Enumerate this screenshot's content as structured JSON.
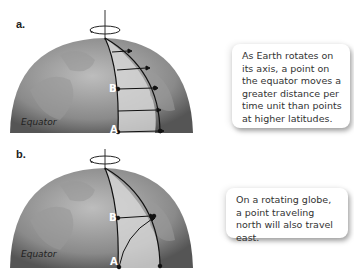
{
  "panels": [
    {
      "label": "a.",
      "equator_label": "Equator",
      "point_a": "A",
      "point_b": "B",
      "callout_text": "As Earth rotates on its axis, a point on the equator moves a greater distance per time unit than points at higher latitudes."
    },
    {
      "label": "b.",
      "equator_label": "Equator",
      "point_a": "A",
      "point_b": "B",
      "callout_text": "On a rotating globe, a point traveling north will also travel east."
    }
  ],
  "colors": {
    "globe_dark": "#6b6b6b",
    "globe_light": "#b8b8b8",
    "highlight_band": "#d9d9d9",
    "line": "#111111"
  }
}
